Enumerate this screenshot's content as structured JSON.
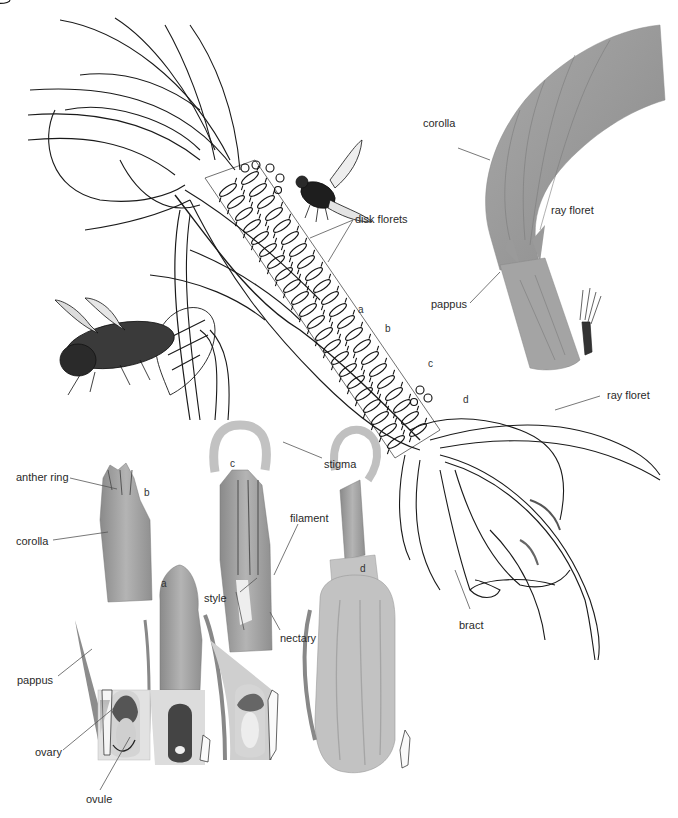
{
  "figure": {
    "colors": {
      "ink": "#1a1a1a",
      "wash": "#9a9a9a",
      "wash_light": "#c8c8c8",
      "leader": "#555555",
      "background": "#ffffff"
    }
  },
  "labels": {
    "disk_florets": "disk florets",
    "ray_floret_top": "ray floret",
    "ray_floret_right": "ray floret",
    "corolla_ray": "corolla",
    "pappus_ray": "pappus",
    "bract": "bract",
    "stigma": "stigma",
    "filament": "filament",
    "style": "style",
    "nectary": "nectary",
    "anther_ring": "anther ring",
    "corolla_disk": "corolla",
    "pappus_disk": "pappus",
    "ovary": "ovary",
    "ovule": "ovule"
  },
  "stage_letters": {
    "head_a": "a",
    "head_b": "b",
    "head_c": "c",
    "head_d": "d",
    "floret_a": "a",
    "floret_b": "b",
    "floret_c": "c",
    "floret_d": "d"
  }
}
